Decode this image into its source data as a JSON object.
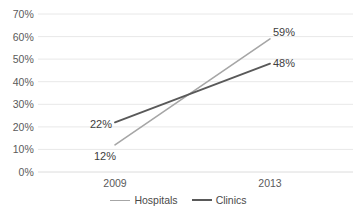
{
  "chart_data": {
    "type": "line",
    "title": "",
    "subtitle": "",
    "xlabel": "",
    "ylabel": "",
    "categories": [
      "2009",
      "2013"
    ],
    "x": [
      2009,
      2013
    ],
    "ylim": [
      0,
      70
    ],
    "y_ticks": [
      "0%",
      "10%",
      "20%",
      "30%",
      "40%",
      "50%",
      "60%",
      "70%"
    ],
    "y_tick_values": [
      0,
      10,
      20,
      30,
      40,
      50,
      60,
      70
    ],
    "x_ticks": [
      "2009",
      "2013"
    ],
    "grid": "horizontal",
    "legend_position": "bottom-center",
    "series": [
      {
        "name": "Hospitals",
        "color": "#a6a6a6",
        "values": [
          12,
          59
        ],
        "labels": [
          "12%",
          "59%"
        ]
      },
      {
        "name": "Clinics",
        "color": "#595959",
        "values": [
          22,
          48
        ],
        "labels": [
          "22%",
          "48%"
        ]
      }
    ],
    "annotations": [
      {
        "text": "22%",
        "series": "Clinics",
        "point": "2009"
      },
      {
        "text": "12%",
        "series": "Hospitals",
        "point": "2009"
      },
      {
        "text": "59%",
        "series": "Hospitals",
        "point": "2013"
      },
      {
        "text": "48%",
        "series": "Clinics",
        "point": "2013"
      }
    ],
    "colors": {
      "grid": "#e8e8e8",
      "text": "#5a5a5a",
      "label_text": "#404040",
      "background": "#ffffff"
    }
  }
}
